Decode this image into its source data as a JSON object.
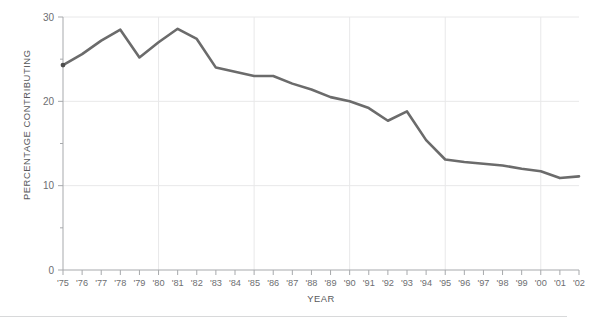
{
  "chart_data": {
    "type": "line",
    "title": "",
    "xlabel": "YEAR",
    "ylabel": "PERCENTAGE CONTRIBUTING",
    "x": [
      "'75",
      "'76",
      "'77",
      "'78",
      "'79",
      "'80",
      "'81",
      "'82",
      "'83",
      "'84",
      "'85",
      "'86",
      "'87",
      "'88",
      "'89",
      "'90",
      "'91",
      "'92",
      "'93",
      "'94",
      "'95",
      "'96",
      "'97",
      "'98",
      "'99",
      "'00",
      "'01",
      "'02"
    ],
    "values": [
      24.3,
      25.6,
      27.2,
      28.5,
      25.2,
      27.0,
      28.6,
      27.4,
      24.0,
      23.5,
      23.0,
      23.0,
      22.1,
      21.4,
      20.5,
      20.0,
      19.2,
      17.7,
      18.8,
      15.4,
      13.1,
      12.8,
      12.6,
      12.4,
      12.0,
      11.7,
      10.9,
      11.1
    ],
    "series": [
      {
        "name": "Percentage contributing",
        "values": [
          24.3,
          25.6,
          27.2,
          28.5,
          25.2,
          27.0,
          28.6,
          27.4,
          24.0,
          23.5,
          23.0,
          23.0,
          22.1,
          21.4,
          20.5,
          20.0,
          19.2,
          17.7,
          18.8,
          15.4,
          13.1,
          12.8,
          12.6,
          12.4,
          12.0,
          11.7,
          10.9,
          11.1
        ]
      }
    ],
    "ylim": [
      0,
      30
    ],
    "y_major_ticks": [
      0,
      10,
      20,
      30
    ],
    "y_major_tick_labels": [
      "0",
      "10",
      "20",
      "30"
    ],
    "y_minor_ticks": [
      5,
      15,
      25
    ],
    "x_gridline_years": [
      "'80",
      "'85",
      "'90",
      "'95",
      "'00"
    ],
    "grid": true,
    "legend": "none",
    "line_color": "#6b6b6b",
    "grid_color": "#e8e8e9",
    "axis_color": "#a7a9ac",
    "text_color": "#6d6e71"
  }
}
